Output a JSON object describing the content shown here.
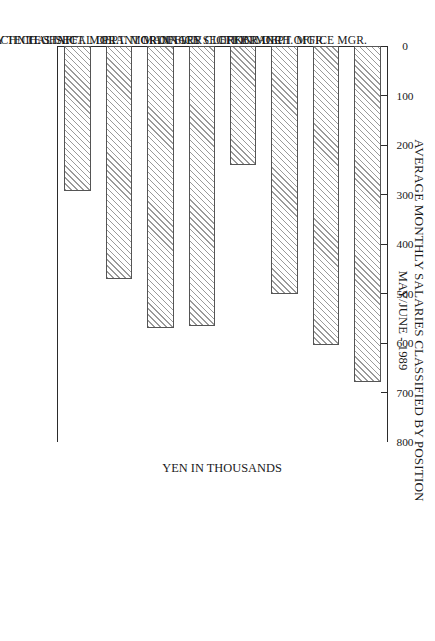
{
  "chart_data": {
    "type": "bar",
    "title": "AVERAGE MONTHLY SALARIES CLASSIFIED BY POSITION",
    "subtitle": "MAY/JUNE - 1989",
    "xlabel": "",
    "ylabel": "YEN IN THOUSANDS",
    "orientation": "vertical-bars-on-rotated-page",
    "grid": false,
    "legend": null,
    "ylim": [
      0,
      800
    ],
    "yticks": [
      0,
      100,
      200,
      300,
      400,
      500,
      600,
      700,
      800
    ],
    "ytick_labels": [
      "0",
      "100",
      "200",
      "300",
      "400",
      "500",
      "600",
      "700",
      "800"
    ],
    "categories": [
      "BRANCH OFFICE MGR.",
      "OFFICE DEPT. MGR.",
      "OFFICE SECTION MGR.",
      "ORDINARY CLERK",
      "PLANT MANAGER",
      "TECHNICAL DEPT. MGR.",
      "TECHNICAL SECT. MGR.",
      "ORDINARY TECH. STAFF"
    ],
    "values": [
      678,
      605,
      500,
      240,
      565,
      570,
      470,
      292
    ],
    "bar_fill": "#ffffff",
    "bar_hatch": "diagonal-lines",
    "bar_edge_color": "#555555",
    "axis_color": "#2b2b2b",
    "background": "#ffffff"
  }
}
